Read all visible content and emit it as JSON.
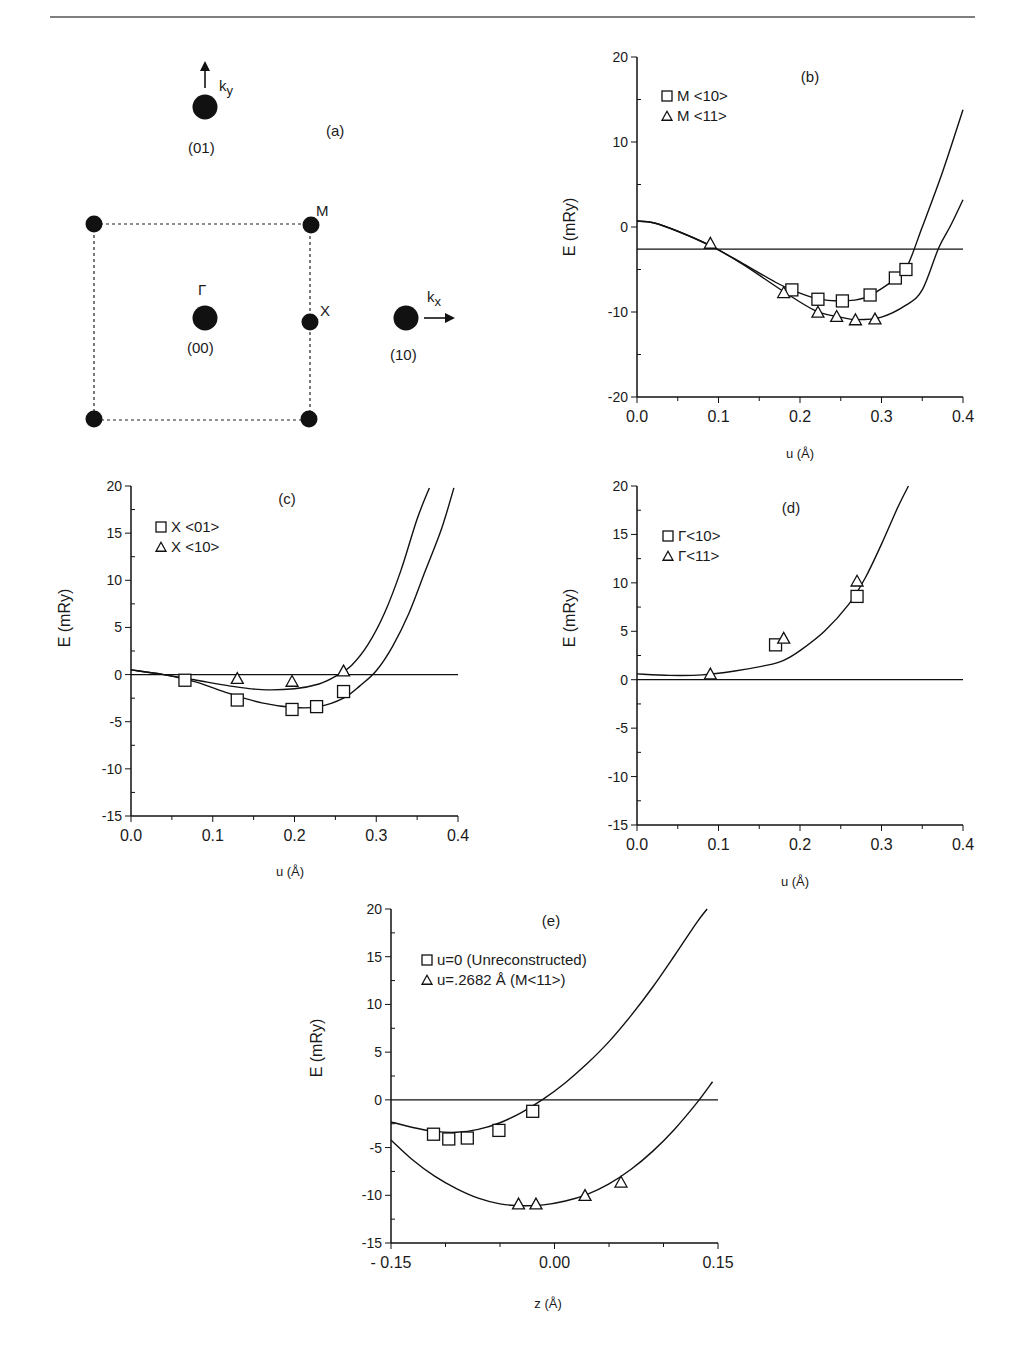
{
  "page": {
    "header_rule": true
  },
  "diagram_a": {
    "panel_label": "(a)",
    "points": [
      {
        "id": "p01",
        "label": "(01)",
        "kind": "reciprocal-lattice-point"
      },
      {
        "id": "p00",
        "label": "(00)",
        "symbol": "Γ",
        "kind": "reciprocal-lattice-point"
      },
      {
        "id": "p10",
        "label": "(10)",
        "kind": "reciprocal-lattice-point"
      },
      {
        "id": "M",
        "label": "M",
        "kind": "zone-corner"
      },
      {
        "id": "X",
        "label": "X",
        "kind": "zone-edge"
      }
    ],
    "arrows": [
      {
        "id": "ky",
        "label": "k",
        "subscript": "y",
        "direction": "up"
      },
      {
        "id": "kx",
        "label": "k",
        "subscript": "x",
        "direction": "right"
      }
    ],
    "brillouin_zone": "dashed-square"
  },
  "chart_data": [
    {
      "id": "b",
      "type": "line",
      "panel_label": "(b)",
      "xlabel": "u  (Å)",
      "ylabel": "E (mRy)",
      "xlim": [
        0.0,
        0.4
      ],
      "ylim": [
        -20,
        20
      ],
      "xticks": [
        "0.0",
        "0.1",
        "0.2",
        "0.3",
        "0.4"
      ],
      "yticks": [
        "20",
        "10",
        "0",
        "-10",
        "-20"
      ],
      "reference_line": -2.6,
      "legend": [
        {
          "marker": "square",
          "label": "M <10>"
        },
        {
          "marker": "triangle",
          "label": "M <11>"
        }
      ],
      "legend_position": "top-left",
      "series": [
        {
          "name": "M <10>",
          "marker": "square",
          "points": [
            [
              0.19,
              -7.4
            ],
            [
              0.222,
              -8.5
            ],
            [
              0.252,
              -8.7
            ],
            [
              0.286,
              -8.0
            ],
            [
              0.317,
              -6.0
            ],
            [
              0.33,
              -5.0
            ]
          ]
        },
        {
          "name": "M <11>",
          "marker": "triangle",
          "points": [
            [
              0.09,
              -1.9
            ],
            [
              0.18,
              -7.7
            ],
            [
              0.222,
              -10.0
            ],
            [
              0.245,
              -10.5
            ],
            [
              0.268,
              -10.9
            ],
            [
              0.292,
              -10.8
            ]
          ]
        }
      ],
      "curves": [
        {
          "name": "fit M <10>",
          "points": [
            [
              0.0,
              0.7
            ],
            [
              0.02,
              0.5
            ],
            [
              0.05,
              -0.5
            ],
            [
              0.09,
              -2.2
            ],
            [
              0.13,
              -4.3
            ],
            [
              0.17,
              -6.5
            ],
            [
              0.19,
              -7.4
            ],
            [
              0.22,
              -8.4
            ],
            [
              0.25,
              -8.7
            ],
            [
              0.28,
              -8.3
            ],
            [
              0.31,
              -6.6
            ],
            [
              0.33,
              -4.9
            ],
            [
              0.35,
              0.0
            ],
            [
              0.375,
              6.5
            ],
            [
              0.4,
              13.8
            ]
          ]
        },
        {
          "name": "fit M <11>",
          "points": [
            [
              0.0,
              0.7
            ],
            [
              0.02,
              0.5
            ],
            [
              0.05,
              -0.5
            ],
            [
              0.09,
              -2.2
            ],
            [
              0.13,
              -4.4
            ],
            [
              0.18,
              -7.6
            ],
            [
              0.22,
              -9.9
            ],
            [
              0.25,
              -10.6
            ],
            [
              0.27,
              -10.9
            ],
            [
              0.3,
              -10.6
            ],
            [
              0.33,
              -9.2
            ],
            [
              0.35,
              -7.4
            ],
            [
              0.37,
              -2.5
            ],
            [
              0.385,
              0.2
            ],
            [
              0.4,
              3.2
            ]
          ]
        }
      ]
    },
    {
      "id": "c",
      "type": "line",
      "panel_label": "(c)",
      "xlabel": "u  (Å)",
      "ylabel": "E (mRy)",
      "xlim": [
        0.0,
        0.4
      ],
      "ylim": [
        -15,
        20
      ],
      "xticks": [
        "0.0",
        "0.1",
        "0.2",
        "0.3",
        "0.4"
      ],
      "yticks": [
        "20",
        "15",
        "10",
        "5",
        "0",
        "-5",
        "-10",
        "-15"
      ],
      "reference_line": 0,
      "legend": [
        {
          "marker": "square",
          "label": "X <01>"
        },
        {
          "marker": "triangle",
          "label": "X <10>"
        }
      ],
      "legend_position": "top-left",
      "series": [
        {
          "name": "X <01>",
          "marker": "square",
          "points": [
            [
              0.066,
              -0.6
            ],
            [
              0.13,
              -2.7
            ],
            [
              0.197,
              -3.7
            ],
            [
              0.227,
              -3.4
            ],
            [
              0.26,
              -1.8
            ]
          ]
        },
        {
          "name": "X <10>",
          "marker": "triangle",
          "points": [
            [
              0.13,
              -0.4
            ],
            [
              0.197,
              -0.7
            ],
            [
              0.26,
              0.4
            ]
          ]
        }
      ],
      "curves": [
        {
          "name": "fit X <01>",
          "points": [
            [
              0.0,
              0.5
            ],
            [
              0.04,
              0.0
            ],
            [
              0.08,
              -0.8
            ],
            [
              0.12,
              -2.0
            ],
            [
              0.16,
              -3.0
            ],
            [
              0.2,
              -3.5
            ],
            [
              0.23,
              -3.4
            ],
            [
              0.26,
              -2.5
            ],
            [
              0.28,
              -1.2
            ],
            [
              0.3,
              0.4
            ],
            [
              0.32,
              3.0
            ],
            [
              0.34,
              6.5
            ],
            [
              0.36,
              11.0
            ],
            [
              0.38,
              15.5
            ],
            [
              0.395,
              19.8
            ]
          ]
        },
        {
          "name": "fit X <10>",
          "points": [
            [
              0.0,
              0.5
            ],
            [
              0.04,
              0.0
            ],
            [
              0.08,
              -0.6
            ],
            [
              0.12,
              -1.2
            ],
            [
              0.16,
              -1.6
            ],
            [
              0.2,
              -1.5
            ],
            [
              0.23,
              -1.0
            ],
            [
              0.25,
              -0.2
            ],
            [
              0.27,
              1.0
            ],
            [
              0.29,
              3.2
            ],
            [
              0.31,
              6.5
            ],
            [
              0.33,
              11.0
            ],
            [
              0.35,
              16.5
            ],
            [
              0.365,
              19.8
            ]
          ]
        }
      ]
    },
    {
      "id": "d",
      "type": "line",
      "panel_label": "(d)",
      "xlabel": "u  (Å)",
      "ylabel": "E (mRy)",
      "xlim": [
        0.0,
        0.4
      ],
      "ylim": [
        -15,
        20
      ],
      "xticks": [
        "0.0",
        "0.1",
        "0.2",
        "0.3",
        "0.4"
      ],
      "yticks": [
        "20",
        "15",
        "10",
        "5",
        "0",
        "-5",
        "-10",
        "-15"
      ],
      "reference_line": 0,
      "legend": [
        {
          "marker": "square",
          "label": "Γ<10>"
        },
        {
          "marker": "triangle",
          "label": "Γ<11>"
        }
      ],
      "legend_position": "top-left",
      "series": [
        {
          "name": "Γ<10>",
          "marker": "square",
          "points": [
            [
              0.17,
              3.6
            ],
            [
              0.27,
              8.6
            ]
          ]
        },
        {
          "name": "Γ<11>",
          "marker": "triangle",
          "points": [
            [
              0.09,
              0.6
            ],
            [
              0.18,
              4.3
            ],
            [
              0.27,
              10.2
            ]
          ]
        }
      ],
      "curves": [
        {
          "name": "fit Γ",
          "points": [
            [
              0.0,
              0.6
            ],
            [
              0.04,
              0.45
            ],
            [
              0.08,
              0.5
            ],
            [
              0.12,
              0.9
            ],
            [
              0.16,
              1.5
            ],
            [
              0.18,
              2.0
            ],
            [
              0.2,
              3.0
            ],
            [
              0.23,
              5.0
            ],
            [
              0.26,
              7.8
            ],
            [
              0.28,
              10.5
            ],
            [
              0.3,
              14.0
            ],
            [
              0.32,
              17.8
            ],
            [
              0.333,
              20.0
            ]
          ]
        }
      ]
    },
    {
      "id": "e",
      "type": "line",
      "panel_label": "(e)",
      "xlabel": "z  (Å)",
      "ylabel": "E (mRy)",
      "xlim": [
        -0.15,
        0.15
      ],
      "ylim": [
        -15,
        20
      ],
      "xticks": [
        "- 0.15",
        "0.00",
        "0.15"
      ],
      "yticks": [
        "20",
        "15",
        "10",
        "5",
        "0",
        "-5",
        "-10",
        "-15"
      ],
      "reference_line": 0,
      "legend": [
        {
          "marker": "square",
          "label": "u=0  (Unreconstructed)"
        },
        {
          "marker": "triangle",
          "label": "u=.2682 Å (M<11>)"
        }
      ],
      "legend_position": "top-left",
      "series": [
        {
          "name": "u=0 (Unreconstructed)",
          "marker": "square",
          "points": [
            [
              -0.111,
              -3.6
            ],
            [
              -0.097,
              -4.1
            ],
            [
              -0.08,
              -4.0
            ],
            [
              -0.051,
              -3.2
            ],
            [
              -0.02,
              -1.2
            ]
          ]
        },
        {
          "name": "u=.2682 Å (M<11>)",
          "marker": "triangle",
          "points": [
            [
              -0.033,
              -10.9
            ],
            [
              -0.017,
              -10.9
            ],
            [
              0.028,
              -10.0
            ],
            [
              0.061,
              -8.6
            ]
          ]
        }
      ],
      "curves": [
        {
          "name": "fit u=0",
          "points": [
            [
              -0.15,
              -2.3
            ],
            [
              -0.13,
              -2.9
            ],
            [
              -0.11,
              -3.3
            ],
            [
              -0.09,
              -3.4
            ],
            [
              -0.07,
              -3.1
            ],
            [
              -0.05,
              -2.4
            ],
            [
              -0.03,
              -1.3
            ],
            [
              -0.01,
              0.1
            ],
            [
              0.01,
              1.8
            ],
            [
              0.03,
              3.8
            ],
            [
              0.05,
              6.1
            ],
            [
              0.07,
              8.8
            ],
            [
              0.09,
              11.8
            ],
            [
              0.11,
              15.1
            ],
            [
              0.13,
              18.5
            ],
            [
              0.14,
              20.0
            ]
          ]
        },
        {
          "name": "fit u=.2682",
          "points": [
            [
              -0.15,
              -4.2
            ],
            [
              -0.13,
              -6.3
            ],
            [
              -0.11,
              -8.0
            ],
            [
              -0.09,
              -9.3
            ],
            [
              -0.07,
              -10.3
            ],
            [
              -0.05,
              -10.9
            ],
            [
              -0.03,
              -11.1
            ],
            [
              -0.01,
              -11.0
            ],
            [
              0.01,
              -10.6
            ],
            [
              0.03,
              -9.9
            ],
            [
              0.05,
              -8.8
            ],
            [
              0.07,
              -7.3
            ],
            [
              0.09,
              -5.4
            ],
            [
              0.11,
              -3.1
            ],
            [
              0.13,
              -0.4
            ],
            [
              0.145,
              1.9
            ]
          ]
        }
      ]
    }
  ]
}
